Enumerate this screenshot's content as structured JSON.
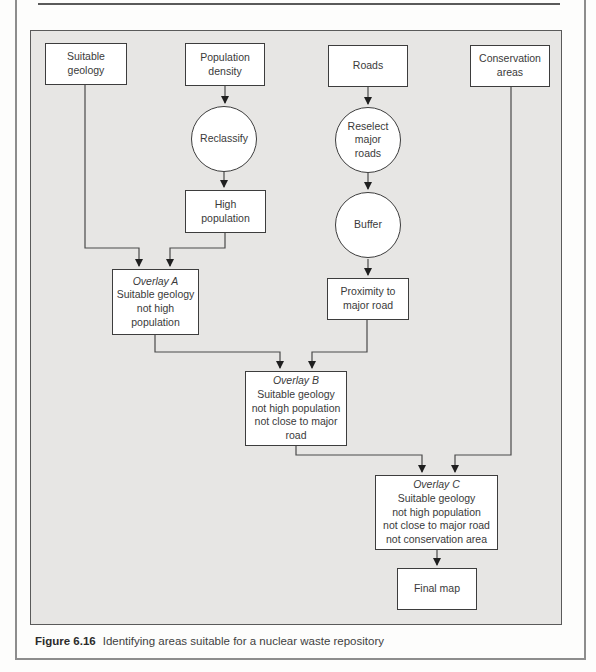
{
  "figure": {
    "caption_label": "Figure 6.16",
    "caption_text": "Identifying areas suitable for a nuclear waste repository"
  },
  "colors": {
    "panel_background": "#e7e6e4",
    "node_fill": "#ffffff",
    "node_border": "#3d3d3d",
    "connector": "#4a4a4a",
    "text": "#3a3a3a"
  },
  "nodes": {
    "suitable_geology": {
      "type": "input",
      "lines": "Suitable\ngeology"
    },
    "population_density": {
      "type": "input",
      "lines": "Population\ndensity"
    },
    "roads": {
      "type": "input",
      "lines": "Roads"
    },
    "conservation_areas": {
      "type": "input",
      "lines": "Conservation\nareas"
    },
    "reclassify": {
      "type": "operation",
      "lines": "Reclassify"
    },
    "reselect_major_roads": {
      "type": "operation",
      "lines": "Reselect\nmajor\nroads"
    },
    "buffer": {
      "type": "operation",
      "lines": "Buffer"
    },
    "high_population": {
      "type": "data",
      "lines": "High\npopulation"
    },
    "proximity_to_major_road": {
      "type": "data",
      "lines": "Proximity to\nmajor road"
    },
    "overlay_a": {
      "type": "overlay",
      "title": "Overlay A",
      "lines": "Suitable geology\nnot high\npopulation"
    },
    "overlay_b": {
      "type": "overlay",
      "title": "Overlay B",
      "lines": "Suitable geology\nnot high population\nnot close to major\nroad"
    },
    "overlay_c": {
      "type": "overlay",
      "title": "Overlay C",
      "lines": "Suitable geology\nnot high population\nnot close to major road\nnot conservation area"
    },
    "final_map": {
      "type": "output",
      "lines": "Final map"
    }
  },
  "edges": [
    "population_density -> reclassify",
    "reclassify -> high_population",
    "roads -> reselect_major_roads",
    "reselect_major_roads -> buffer",
    "buffer -> proximity_to_major_road",
    "suitable_geology -> overlay_a",
    "high_population -> overlay_a",
    "overlay_a -> overlay_b",
    "proximity_to_major_road -> overlay_b",
    "overlay_b -> overlay_c",
    "conservation_areas -> overlay_c",
    "overlay_c -> final_map"
  ]
}
